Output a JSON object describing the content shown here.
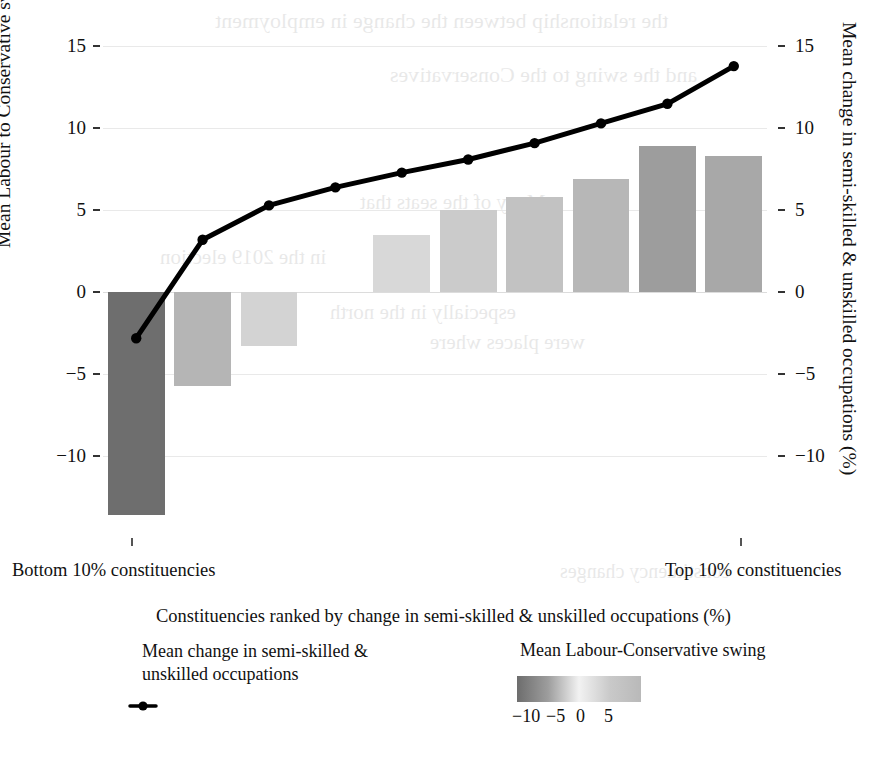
{
  "chart_data": {
    "type": "bar",
    "title": "",
    "subtitle": "",
    "xlabel": "Constituencies ranked by change in semi-skilled & unskilled occupations (%)",
    "ylabel_left": "Mean Labour to Conservative swing",
    "ylabel_right": "Mean change in semi-skilled & unskilled occupations (%)",
    "x_axis_left_label": "Bottom 10% constituencies",
    "x_axis_right_label": "Top 10% constituencies",
    "categories": [
      "1",
      "2",
      "3",
      "4",
      "5",
      "6",
      "7",
      "8",
      "9",
      "10"
    ],
    "ylim": [
      -14.5,
      16
    ],
    "yticks_left": [
      "15",
      "10",
      "5",
      "0",
      "-5",
      "-10"
    ],
    "yticks_left_values": [
      15,
      10,
      5,
      0,
      -5,
      -10
    ],
    "yticks_right": [
      "15",
      "10",
      "5",
      "0",
      "-5",
      "-10"
    ],
    "yticks_right_values": [
      15,
      10,
      5,
      0,
      -5,
      -10
    ],
    "grid": true,
    "legend_position": "bottom",
    "series": [
      {
        "name": "Mean Labour-Conservative swing",
        "type": "bar",
        "axis": "left",
        "values": [
          -13.6,
          -5.7,
          -3.3,
          null,
          3.5,
          5.0,
          5.8,
          6.9,
          8.9,
          8.3
        ],
        "colors": [
          "#6e6e6e",
          "#b5b5b5",
          "#d3d3d3",
          null,
          "#d8d8d8",
          "#cbcbcb",
          "#c2c2c2",
          "#b7b7b7",
          "#9d9d9d",
          "#a8a8a8"
        ]
      },
      {
        "name": "Mean change in semi-skilled & unskilled occupations",
        "type": "line",
        "axis": "right",
        "values": [
          -2.8,
          3.2,
          5.3,
          6.4,
          7.3,
          8.1,
          9.1,
          10.3,
          11.5,
          13.8
        ],
        "color": "#000000",
        "marker": "circle"
      }
    ],
    "colorbar": {
      "title": "Mean Labour-Conservative swing",
      "tick_labels": [
        "-10",
        "-5",
        "0",
        "5"
      ],
      "tick_values": [
        -10,
        -5,
        0,
        5
      ],
      "stops": [
        "#6d6d6d",
        "#9d9d9d",
        "#f2f2f2",
        "#c9c9c9",
        "#b9b9b9"
      ]
    }
  },
  "legend": {
    "line_entry_line1": "Mean change in semi-skilled &",
    "line_entry_line2": "unskilled occupations",
    "colorbar_title": "Mean Labour-Conservative swing"
  },
  "ghost_text": {
    "l1": "the relationship between the change in employment",
    "l2": "and the swing to the Conservatives",
    "l3": "Many of the seats that",
    "l4": "in the 2019 election",
    "l5": "especially in the north",
    "l6": "were places where",
    "l7": "constituency changes"
  }
}
